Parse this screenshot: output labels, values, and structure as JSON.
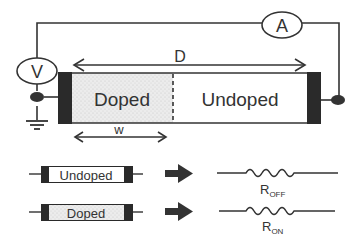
{
  "diagram": {
    "meters": {
      "voltmeter": "V",
      "ammeter": "A"
    },
    "device": {
      "doped_label": "Doped",
      "undoped_label": "Undoped",
      "total_length_label": "D",
      "doped_width_label": "w"
    },
    "legend": [
      {
        "state": "Undoped",
        "resistor": "R",
        "subscript": "OFF"
      },
      {
        "state": "Doped",
        "resistor": "R",
        "subscript": "ON"
      }
    ],
    "colors": {
      "line": "#333333",
      "electrode": "#222222",
      "doped_fill": "#e8e8e8",
      "undoped_fill": "#ffffff"
    }
  }
}
